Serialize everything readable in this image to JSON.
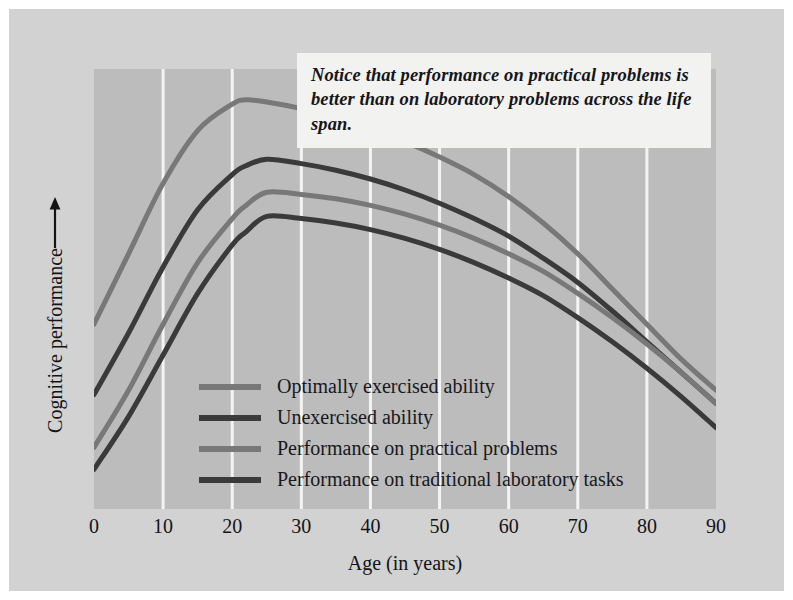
{
  "figure": {
    "background_color": "#d2d2d2",
    "plot_background_color": "#bcbcbc"
  },
  "callout": {
    "text": "Notice that performance on practical problems is better than on laboratory problems across the life span.",
    "background_color": "#f2f2f0"
  },
  "legend": {
    "items": [
      {
        "label": "Optimally exercised ability",
        "color": "#787878"
      },
      {
        "label": "Unexercised ability",
        "color": "#3a3a3a"
      },
      {
        "label": "Performance on practical problems",
        "color": "#787878"
      },
      {
        "label": "Performance on traditional laboratory tasks",
        "color": "#3a3a3a"
      }
    ]
  },
  "axes": {
    "x_title": "Age (in years)",
    "y_title": "Cognitive performance",
    "y_arrow": "up-arrow",
    "x_ticks": [
      "0",
      "10",
      "20",
      "30",
      "40",
      "50",
      "60",
      "70",
      "80",
      "90"
    ]
  },
  "chart_data": {
    "type": "line",
    "title": "",
    "xlabel": "Age (in years)",
    "ylabel": "Cognitive performance",
    "xlim": [
      0,
      90
    ],
    "ylim": [
      0,
      100
    ],
    "xticks": [
      0,
      10,
      20,
      30,
      40,
      50,
      60,
      70,
      80,
      90
    ],
    "yticks": [],
    "grid": "vertical-only-white",
    "legend_position": "inside-lower-left",
    "annotations": [
      "Notice that performance on practical problems is better than on laboratory problems across the life span."
    ],
    "x": [
      0,
      5,
      10,
      15,
      20,
      22,
      25,
      30,
      35,
      40,
      45,
      50,
      55,
      60,
      65,
      70,
      75,
      80,
      85,
      90
    ],
    "series": [
      {
        "name": "Optimally exercised ability",
        "color": "#787878",
        "values": [
          42,
          58,
          74,
          86,
          92,
          93,
          92.5,
          91,
          89,
          86.5,
          83.5,
          80,
          76,
          71,
          65,
          58,
          50,
          42,
          34,
          27
        ]
      },
      {
        "name": "Unexercised ability",
        "color": "#3a3a3a",
        "values": [
          26,
          40,
          55,
          68,
          76,
          78,
          79.5,
          78.5,
          77,
          75,
          72.5,
          69.5,
          66,
          62,
          57,
          51.5,
          45,
          38,
          31,
          24
        ]
      },
      {
        "name": "Performance on practical problems",
        "color": "#787878",
        "values": [
          14,
          27,
          42,
          56,
          66,
          69,
          72,
          71.5,
          70.5,
          69,
          67,
          64.5,
          61.5,
          58,
          54,
          49,
          43.5,
          37.5,
          31,
          24
        ]
      },
      {
        "name": "Performance on traditional laboratory tasks",
        "color": "#3a3a3a",
        "values": [
          9,
          21,
          35,
          49,
          60,
          63,
          66.5,
          66,
          65,
          63.5,
          61.5,
          59,
          56,
          52.5,
          48.5,
          43.5,
          38,
          32,
          25.5,
          18.5
        ]
      }
    ]
  }
}
